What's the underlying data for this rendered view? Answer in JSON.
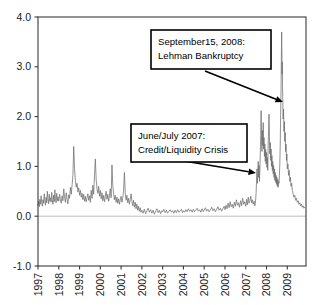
{
  "chart_data": {
    "type": "line",
    "title": "",
    "xlabel": "",
    "ylabel": "",
    "xlim": [
      1997.0,
      2009.9
    ],
    "ylim": [
      -1.0,
      4.0
    ],
    "grid": false,
    "legend": "none",
    "series_name": "spread",
    "line_color": "#6e6e6e",
    "zero_line_color": "#b9b9b9",
    "y_ticks": [
      "4.0",
      "3.0",
      "2.0",
      "1.0",
      "0.0",
      "-1.0"
    ],
    "y_tick_values": [
      4.0,
      3.0,
      2.0,
      1.0,
      0.0,
      -1.0
    ],
    "x_ticks": [
      "1997",
      "1998",
      "1999",
      "2000",
      "2001",
      "2002",
      "2003",
      "2004",
      "2005",
      "2006",
      "2007",
      "2008",
      "2009"
    ],
    "x_tick_values": [
      1997,
      1998,
      1999,
      2000,
      2001,
      2002,
      2003,
      2004,
      2005,
      2006,
      2007,
      2008,
      2009
    ],
    "x": [
      1997.0,
      1997.03,
      1997.06,
      1997.09,
      1997.12,
      1997.15,
      1997.18,
      1997.21,
      1997.24,
      1997.27,
      1997.3,
      1997.33,
      1997.36,
      1997.39,
      1997.42,
      1997.45,
      1997.48,
      1997.51,
      1997.54,
      1997.57,
      1997.6,
      1997.63,
      1997.66,
      1997.69,
      1997.72,
      1997.75,
      1997.78,
      1997.81,
      1997.84,
      1997.87,
      1997.9,
      1997.93,
      1997.96,
      1998.0,
      1998.04,
      1998.08,
      1998.12,
      1998.16,
      1998.2,
      1998.24,
      1998.28,
      1998.32,
      1998.36,
      1998.4,
      1998.44,
      1998.48,
      1998.52,
      1998.56,
      1998.6,
      1998.64,
      1998.68,
      1998.72,
      1998.76,
      1998.8,
      1998.84,
      1998.88,
      1998.92,
      1998.96,
      1999.0,
      1999.04,
      1999.08,
      1999.12,
      1999.16,
      1999.2,
      1999.24,
      1999.28,
      1999.32,
      1999.36,
      1999.4,
      1999.44,
      1999.48,
      1999.52,
      1999.56,
      1999.6,
      1999.64,
      1999.68,
      1999.72,
      1999.76,
      1999.8,
      1999.84,
      1999.88,
      1999.92,
      1999.96,
      2000.0,
      2000.04,
      2000.08,
      2000.12,
      2000.16,
      2000.2,
      2000.24,
      2000.28,
      2000.32,
      2000.36,
      2000.4,
      2000.44,
      2000.48,
      2000.52,
      2000.56,
      2000.6,
      2000.64,
      2000.68,
      2000.72,
      2000.76,
      2000.8,
      2000.84,
      2000.88,
      2000.92,
      2000.96,
      2001.0,
      2001.04,
      2001.08,
      2001.12,
      2001.16,
      2001.2,
      2001.24,
      2001.28,
      2001.32,
      2001.36,
      2001.4,
      2001.44,
      2001.48,
      2001.52,
      2001.56,
      2001.6,
      2001.64,
      2001.68,
      2001.72,
      2001.76,
      2001.8,
      2001.84,
      2001.88,
      2001.92,
      2001.96,
      2002.0,
      2002.06,
      2002.12,
      2002.18,
      2002.24,
      2002.3,
      2002.36,
      2002.42,
      2002.48,
      2002.54,
      2002.6,
      2002.66,
      2002.72,
      2002.78,
      2002.84,
      2002.9,
      2002.96,
      2003.0,
      2003.06,
      2003.12,
      2003.18,
      2003.24,
      2003.3,
      2003.36,
      2003.42,
      2003.48,
      2003.54,
      2003.6,
      2003.66,
      2003.72,
      2003.78,
      2003.84,
      2003.9,
      2003.96,
      2004.0,
      2004.06,
      2004.12,
      2004.18,
      2004.24,
      2004.3,
      2004.36,
      2004.42,
      2004.48,
      2004.54,
      2004.6,
      2004.66,
      2004.72,
      2004.78,
      2004.84,
      2004.9,
      2004.96,
      2005.0,
      2005.06,
      2005.12,
      2005.18,
      2005.24,
      2005.3,
      2005.36,
      2005.42,
      2005.48,
      2005.54,
      2005.6,
      2005.66,
      2005.72,
      2005.78,
      2005.84,
      2005.9,
      2005.96,
      2006.0,
      2006.05,
      2006.1,
      2006.15,
      2006.2,
      2006.25,
      2006.3,
      2006.35,
      2006.4,
      2006.45,
      2006.5,
      2006.55,
      2006.6,
      2006.65,
      2006.7,
      2006.75,
      2006.8,
      2006.85,
      2006.9,
      2006.95,
      2007.0,
      2007.04,
      2007.08,
      2007.12,
      2007.16,
      2007.2,
      2007.24,
      2007.28,
      2007.32,
      2007.36,
      2007.4,
      2007.44,
      2007.46,
      2007.48,
      2007.5,
      2007.52,
      2007.54,
      2007.56,
      2007.58,
      2007.6,
      2007.62,
      2007.64,
      2007.66,
      2007.68,
      2007.7,
      2007.72,
      2007.74,
      2007.76,
      2007.78,
      2007.8,
      2007.82,
      2007.84,
      2007.86,
      2007.88,
      2007.9,
      2007.92,
      2007.94,
      2007.96,
      2007.98,
      2008.0,
      2008.02,
      2008.04,
      2008.06,
      2008.08,
      2008.1,
      2008.12,
      2008.14,
      2008.16,
      2008.18,
      2008.2,
      2008.22,
      2008.24,
      2008.26,
      2008.28,
      2008.3,
      2008.32,
      2008.34,
      2008.36,
      2008.38,
      2008.4,
      2008.42,
      2008.44,
      2008.46,
      2008.48,
      2008.5,
      2008.52,
      2008.54,
      2008.56,
      2008.58,
      2008.6,
      2008.62,
      2008.64,
      2008.66,
      2008.68,
      2008.7,
      2008.71,
      2008.72,
      2008.73,
      2008.74,
      2008.75,
      2008.76,
      2008.77,
      2008.78,
      2008.8,
      2008.82,
      2008.84,
      2008.86,
      2008.88,
      2008.9,
      2008.92,
      2008.94,
      2008.96,
      2008.98,
      2009.0,
      2009.03,
      2009.06,
      2009.09,
      2009.12,
      2009.15,
      2009.18,
      2009.21,
      2009.24,
      2009.28,
      2009.32,
      2009.36,
      2009.4,
      2009.44,
      2009.48,
      2009.52,
      2009.56,
      2009.6,
      2009.64,
      2009.68,
      2009.72,
      2009.76,
      2009.8,
      2009.84
    ],
    "values": [
      0.22,
      0.3,
      0.19,
      0.34,
      0.24,
      0.41,
      0.28,
      0.2,
      0.33,
      0.26,
      0.45,
      0.31,
      0.22,
      0.38,
      0.27,
      0.5,
      0.34,
      0.25,
      0.44,
      0.3,
      0.37,
      0.28,
      0.48,
      0.33,
      0.24,
      0.42,
      0.29,
      0.53,
      0.36,
      0.27,
      0.46,
      0.31,
      0.39,
      0.3,
      0.44,
      0.33,
      0.26,
      0.41,
      0.31,
      0.55,
      0.38,
      0.28,
      0.47,
      0.34,
      0.25,
      0.43,
      0.36,
      0.58,
      0.44,
      0.62,
      0.81,
      1.4,
      0.95,
      0.72,
      0.58,
      0.66,
      0.49,
      0.57,
      0.42,
      0.52,
      0.38,
      0.46,
      0.33,
      0.44,
      0.3,
      0.4,
      0.29,
      0.37,
      0.45,
      0.32,
      0.41,
      0.28,
      0.52,
      0.36,
      0.62,
      0.44,
      0.82,
      1.15,
      0.74,
      0.55,
      0.46,
      0.6,
      0.4,
      0.52,
      0.35,
      0.47,
      0.31,
      0.42,
      0.29,
      0.39,
      0.5,
      0.34,
      0.44,
      0.3,
      0.41,
      0.55,
      0.37,
      1.03,
      0.62,
      0.45,
      0.33,
      0.42,
      0.28,
      0.38,
      0.26,
      0.35,
      0.24,
      0.33,
      0.4,
      0.28,
      0.36,
      0.52,
      0.88,
      0.46,
      0.32,
      0.42,
      0.27,
      0.36,
      0.24,
      0.33,
      0.45,
      0.3,
      0.21,
      0.32,
      0.18,
      0.28,
      0.15,
      0.24,
      0.12,
      0.2,
      0.1,
      0.17,
      0.08,
      0.12,
      0.06,
      0.14,
      0.05,
      0.11,
      0.16,
      0.08,
      0.13,
      0.06,
      0.12,
      0.04,
      0.1,
      0.15,
      0.07,
      0.12,
      0.05,
      0.11,
      0.09,
      0.14,
      0.07,
      0.12,
      0.06,
      0.1,
      0.13,
      0.08,
      0.11,
      0.06,
      0.12,
      0.07,
      0.13,
      0.08,
      0.1,
      0.14,
      0.07,
      0.11,
      0.08,
      0.13,
      0.09,
      0.15,
      0.1,
      0.13,
      0.08,
      0.14,
      0.09,
      0.12,
      0.16,
      0.1,
      0.13,
      0.08,
      0.15,
      0.09,
      0.12,
      0.17,
      0.1,
      0.14,
      0.09,
      0.13,
      0.18,
      0.11,
      0.15,
      0.09,
      0.14,
      0.19,
      0.12,
      0.16,
      0.1,
      0.15,
      0.2,
      0.13,
      0.22,
      0.15,
      0.26,
      0.17,
      0.29,
      0.19,
      0.24,
      0.16,
      0.28,
      0.2,
      0.33,
      0.22,
      0.27,
      0.18,
      0.31,
      0.21,
      0.36,
      0.24,
      0.29,
      0.2,
      0.34,
      0.23,
      0.38,
      0.26,
      0.31,
      0.4,
      0.27,
      0.33,
      0.24,
      0.3,
      0.21,
      0.26,
      0.35,
      0.48,
      0.72,
      0.95,
      0.66,
      0.88,
      1.1,
      0.78,
      1.02,
      0.7,
      0.92,
      1.25,
      1.62,
      2.12,
      1.55,
      1.3,
      1.72,
      1.42,
      1.88,
      1.35,
      1.58,
      1.2,
      1.45,
      1.1,
      1.34,
      1.05,
      1.28,
      0.98,
      1.18,
      0.92,
      1.45,
      1.75,
      2.05,
      1.6,
      1.25,
      1.48,
      1.12,
      1.35,
      1.0,
      1.22,
      0.92,
      1.1,
      0.85,
      1.02,
      0.78,
      0.95,
      0.72,
      0.88,
      0.68,
      0.82,
      0.64,
      0.78,
      0.6,
      0.74,
      0.58,
      0.7,
      0.66,
      0.82,
      1.05,
      1.45,
      2.05,
      2.55,
      3.05,
      3.45,
      3.7,
      3.3,
      2.85,
      3.1,
      2.6,
      2.4,
      1.95,
      2.15,
      1.7,
      1.9,
      1.5,
      1.68,
      1.3,
      1.45,
      1.12,
      1.25,
      0.95,
      1.05,
      0.82,
      0.92,
      0.7,
      0.78,
      0.6,
      0.66,
      0.52,
      0.45,
      0.38,
      0.42,
      0.32,
      0.36,
      0.28,
      0.31,
      0.24,
      0.27,
      0.21,
      0.24,
      0.18,
      0.21,
      0.16,
      0.18
    ],
    "annotations": [
      {
        "id": "lehman",
        "line1": "September15, 2008:",
        "line2": "Lehman  Bankruptcy",
        "box": {
          "x": 151,
          "y": 30,
          "w": 120,
          "h": 39
        },
        "arrow": {
          "x1": 205,
          "y1": 71,
          "x2": 283,
          "y2": 102
        }
      },
      {
        "id": "credit-crisis",
        "line1": "June/July 2007:",
        "line2": "Credit/Liquidity Crisis",
        "box": {
          "x": 131,
          "y": 124,
          "w": 116,
          "h": 38
        },
        "arrow": {
          "x1": 184,
          "y1": 161,
          "x2": 256,
          "y2": 173
        }
      }
    ]
  }
}
